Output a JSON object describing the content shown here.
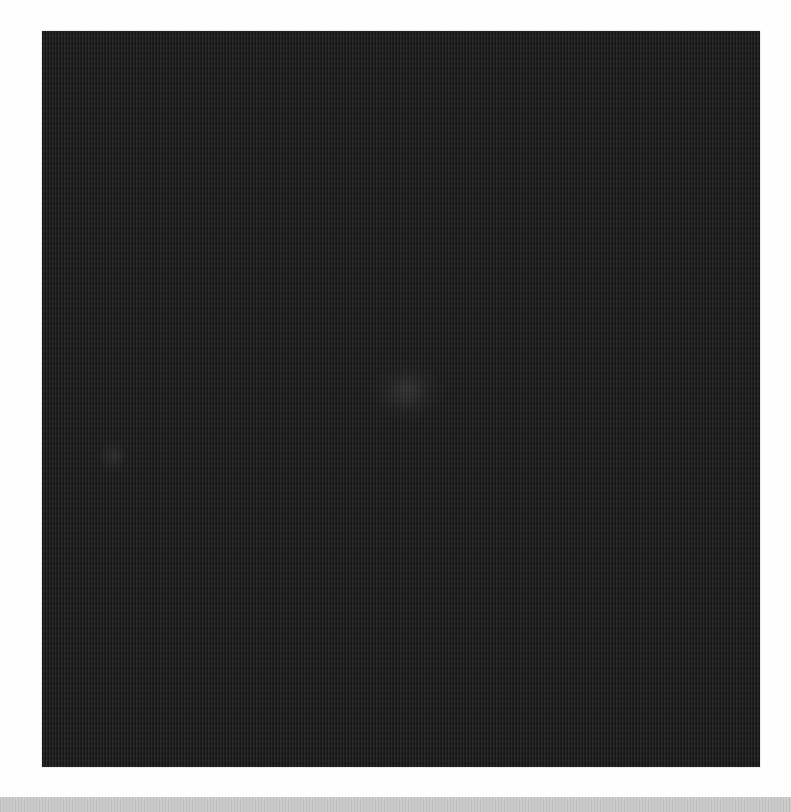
{
  "image": {
    "subject": "dark textured surface",
    "colors": {
      "page_background": "#fefefe",
      "panel": "#232323",
      "highlight": "#4a4a4a",
      "bottom_bar": "#c9c9c9"
    },
    "features": [
      {
        "name": "center-highlight",
        "description": "faint lighter spot near center"
      },
      {
        "name": "left-highlight",
        "description": "faint lighter spot on left side"
      }
    ]
  }
}
